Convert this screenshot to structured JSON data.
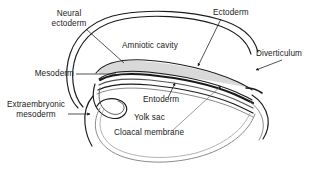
{
  "figure": {
    "background_color": "#ffffff",
    "line_color": "#1a1a1a",
    "shade_color": "#d9d9d9",
    "faint_line_color": "#9a9a9a",
    "labels": {
      "neural_ectoderm_line1": "Neural",
      "neural_ectoderm_line2": "ectoderm",
      "ectoderm": "Ectoderm",
      "amniotic_cavity": "Amniotic cavity",
      "diverticulum": "Diverticulum",
      "mesoderm": "Mesoderm",
      "entoderm": "Entoderm",
      "extraembryonic_line1": "Extraembryonic",
      "extraembryonic_line2": "mesoderm",
      "yolk_sac": "Yolk sac",
      "cloacal_membrane": "Cloacal membrane"
    }
  }
}
